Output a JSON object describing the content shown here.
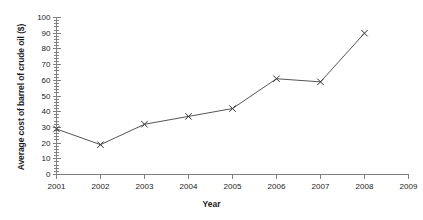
{
  "chart_data": {
    "type": "line",
    "title": "",
    "xlabel": "Year",
    "ylabel": "Average cost of barrel of crude oil ($)",
    "categories": [
      2001,
      2002,
      2003,
      2004,
      2005,
      2006,
      2007,
      2008
    ],
    "values": [
      29,
      19,
      32,
      37,
      42,
      61,
      59,
      90
    ],
    "series": [
      {
        "name": "Average cost of barrel of crude oil ($)",
        "values": [
          29,
          19,
          32,
          37,
          42,
          61,
          59,
          90
        ]
      }
    ],
    "xlim": [
      2001,
      2009
    ],
    "ylim": [
      0,
      100
    ],
    "x_ticks": [
      2001,
      2002,
      2003,
      2004,
      2005,
      2006,
      2007,
      2008,
      2009
    ],
    "x_tick_labels": [
      "2001",
      "2002",
      "2003",
      "2004",
      "2005",
      "2006",
      "2007",
      "2008",
      "2009"
    ],
    "y_ticks": [
      0,
      10,
      20,
      30,
      40,
      50,
      60,
      70,
      80,
      90,
      100
    ],
    "y_tick_labels": [
      "0",
      "10",
      "20",
      "30",
      "40",
      "50",
      "60",
      "70",
      "80",
      "90",
      "100"
    ],
    "y_minor_tick_step": 2,
    "grid": false,
    "legend": false,
    "legend_position": "none",
    "marker": "x",
    "line_color": "#555555",
    "marker_color": "#333333",
    "axis_color": "#808080",
    "background_color": "#ffffff"
  }
}
